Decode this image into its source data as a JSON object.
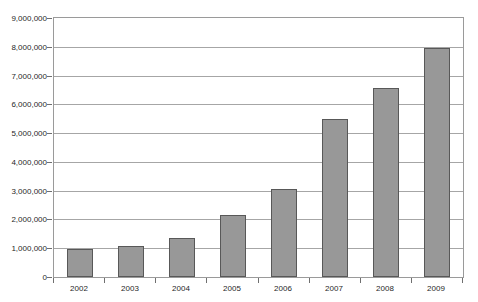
{
  "chart_data": {
    "type": "bar",
    "title": "",
    "xlabel": "",
    "ylabel": "",
    "categories": [
      "2002",
      "2003",
      "2004",
      "2005",
      "2006",
      "2007",
      "2008",
      "2009"
    ],
    "values": [
      970000,
      1070000,
      1350000,
      2170000,
      3050000,
      5480000,
      6580000,
      7950000
    ],
    "ylim": [
      0,
      9000000
    ],
    "ytick_labels": [
      "9,000,000",
      "8,000,000",
      "7,000,000",
      "6,000,000",
      "5,000,000",
      "4,000,000",
      "3,000,000",
      "2,000,000",
      "1,000,000",
      "0"
    ],
    "ytick_values": [
      9000000,
      8000000,
      7000000,
      6000000,
      5000000,
      4000000,
      3000000,
      2000000,
      1000000,
      0
    ],
    "grid": true,
    "legend": false,
    "bar_color": "#989898",
    "bar_border_color": "#585858",
    "gridline_color": "#a6a6a6",
    "plot_border_color": "#9a9a9a"
  },
  "title_remnant": "............."
}
